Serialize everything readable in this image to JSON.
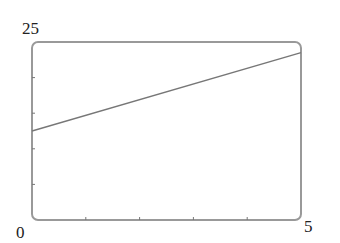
{
  "chart_data": {
    "type": "line",
    "title": "",
    "xlabel": "",
    "ylabel": "",
    "xlim": [
      0,
      5
    ],
    "ylim": [
      0,
      25
    ],
    "x_tick_labels": [
      "0",
      "5"
    ],
    "y_tick_labels": [
      "0",
      "25"
    ],
    "x_minor_ticks": [
      1,
      2,
      3,
      4
    ],
    "y_minor_ticks": [
      5,
      10,
      15,
      20
    ],
    "grid": false,
    "legend": null,
    "series": [
      {
        "name": "line",
        "x": [
          0,
          5
        ],
        "y": [
          12.5,
          23.5
        ],
        "color": "#777777"
      }
    ]
  },
  "labels": {
    "y_max": "25",
    "origin": "0",
    "x_max": "5"
  },
  "colors": {
    "frame": "#999999",
    "line": "#777777",
    "text": "#222222"
  }
}
